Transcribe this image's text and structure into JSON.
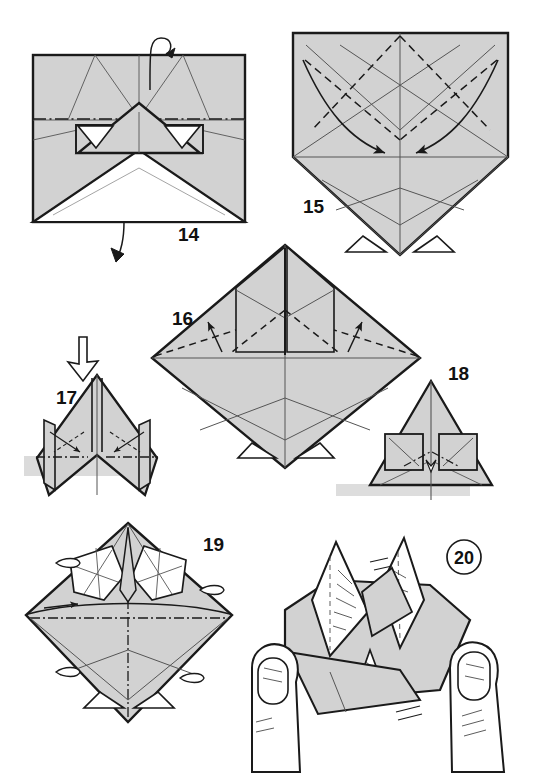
{
  "document": {
    "title": "Origami folding instructions, steps 14-20",
    "page_background": "#ffffff",
    "paper_fill": "#d2d2d2",
    "paper_fill_light": "#e2e2e2",
    "paper_white": "#ffffff",
    "line_color": "#1a1a1a",
    "crease_color": "#4a4a4a",
    "shadow_color": "#c9c9c9"
  },
  "steps": [
    {
      "id": "step-14",
      "number": "14",
      "label_x": 178,
      "label_y": 241,
      "shape": "rectangle-with-inner-triangle",
      "annotations": [
        "turn-over-loop-arrow-top",
        "curved-arrow-down-bottom"
      ]
    },
    {
      "id": "step-15",
      "number": "15",
      "label_x": 303,
      "label_y": 213,
      "shape": "pentagon-kite",
      "annotations": [
        "curved-arrow-left-inward",
        "curved-arrow-right-inward",
        "dashed-valley-folds"
      ]
    },
    {
      "id": "step-16",
      "number": "16",
      "label_x": 172,
      "label_y": 325,
      "shape": "diamond-with-flaps",
      "annotations": [
        "arrow-up-left",
        "arrow-up-right",
        "dashed-valley-folds"
      ]
    },
    {
      "id": "step-17",
      "number": "17",
      "label_x": 56,
      "label_y": 404,
      "shape": "front-view-wings",
      "annotations": [
        "hollow-view-arrow",
        "crossing-arrows-left",
        "crossing-arrows-right",
        "dash-dot-folds"
      ]
    },
    {
      "id": "step-18",
      "number": "18",
      "label_x": 448,
      "label_y": 380,
      "shape": "front-view-triangle",
      "annotations": [
        "zoom-square-left",
        "zoom-square-right",
        "dash-dot-fold"
      ]
    },
    {
      "id": "step-19",
      "number": "19",
      "label_x": 203,
      "label_y": 551,
      "shape": "diamond-with-star-points",
      "annotations": [
        "rotate-tabs",
        "dash-dot-center-lines"
      ]
    },
    {
      "id": "step-20",
      "number": "20",
      "label_x": 458,
      "label_y": 563,
      "circled": true,
      "shape": "finished-model-in-hands",
      "annotations": [
        "left-hand",
        "right-hand",
        "shading-hatch"
      ]
    }
  ],
  "legend": {
    "valley_fold": "dashed line",
    "mountain_fold": "dash-dot line",
    "fold_direction": "solid arrow",
    "turn_over": "looped arrow",
    "view_direction": "hollow arrow"
  }
}
